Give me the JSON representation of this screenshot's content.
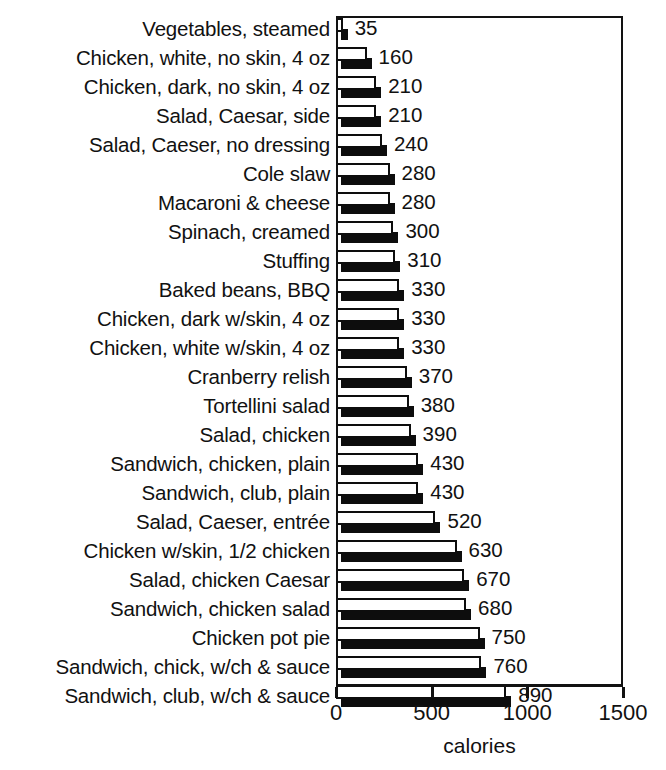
{
  "chart_data": {
    "type": "bar",
    "orientation": "horizontal",
    "title": "",
    "xlabel": "calories",
    "ylabel": "",
    "xlim": [
      0,
      1500
    ],
    "xticks": [
      0,
      500,
      1000,
      1500
    ],
    "xtick_labels": [
      "0",
      "500",
      "1000",
      "1500"
    ],
    "grid": false,
    "legend": null,
    "value_labels_shown": true,
    "categories": [
      "Vegetables, steamed",
      "Chicken, white, no skin, 4 oz",
      "Chicken, dark, no skin, 4 oz",
      "Salad, Caesar, side",
      "Salad, Caeser, no dressing",
      "Cole slaw",
      "Macaroni & cheese",
      "Spinach, creamed",
      "Stuffing",
      "Baked beans, BBQ",
      "Chicken, dark w/skin, 4 oz",
      "Chicken, white w/skin, 4 oz",
      "Cranberry relish",
      "Tortellini salad",
      "Salad, chicken",
      "Sandwich, chicken, plain",
      "Sandwich, club, plain",
      "Salad, Caeser, entrée",
      "Chicken w/skin, 1/2 chicken",
      "Salad, chicken Caesar",
      "Sandwich, chicken salad",
      "Chicken pot pie",
      "Sandwich, chick, w/ch & sauce",
      "Sandwich, club, w/ch & sauce"
    ],
    "values": [
      35,
      160,
      210,
      210,
      240,
      280,
      280,
      300,
      310,
      330,
      330,
      330,
      370,
      380,
      390,
      430,
      430,
      520,
      630,
      670,
      680,
      750,
      760,
      890
    ],
    "value_labels": [
      "35",
      "160",
      "210",
      "210",
      "240",
      "280",
      "280",
      "300",
      "310",
      "330",
      "330",
      "330",
      "370",
      "380",
      "390",
      "430",
      "430",
      "520",
      "630",
      "670",
      "680",
      "750",
      "760",
      "890"
    ],
    "colors": {
      "bar_face": "#ffffff",
      "bar_outline": "#0d0d0d",
      "bar_shadow": "#0d0d0d",
      "axis": "#121212",
      "text": "#111111",
      "background": "#ffffff"
    }
  },
  "axis_title": "calories"
}
